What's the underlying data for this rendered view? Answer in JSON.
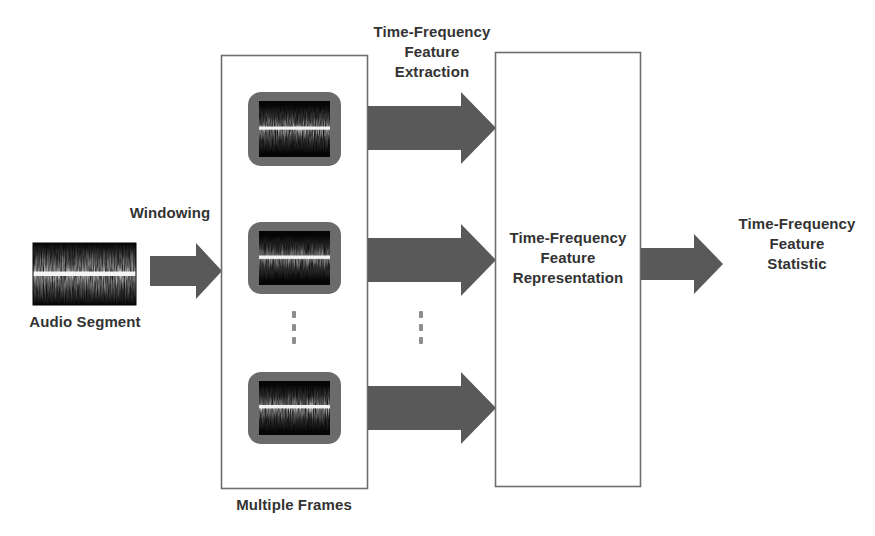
{
  "figure": {
    "type": "block-diagram",
    "colors": {
      "arrow": "#595959",
      "box_border": "#6e6e6e",
      "frame_border": "#6b6b6b",
      "waveform_bg": "#050505",
      "waveform_line": "#f2f2f2",
      "text": "#333333",
      "dots": "#8d8d8d",
      "background": "#ffffff"
    }
  },
  "nodes": {
    "audio_segment": {
      "label": "Audio Segment",
      "kind": "waveform-image"
    },
    "multiple_frames": {
      "label": "Multiple Frames",
      "kind": "container-box",
      "frames": [
        {
          "name": "frame-1"
        },
        {
          "name": "frame-2"
        },
        {
          "name": "frame-3"
        }
      ],
      "ellipsis": "vertical-dots"
    },
    "tf_representation": {
      "label": "Time-Frequency\nFeature\nRepresentation",
      "kind": "container-box"
    },
    "tf_statistic": {
      "label": "Time-Frequency\nFeature\nStatistic",
      "kind": "text-node"
    }
  },
  "edges": [
    {
      "name": "windowing-arrow",
      "label": "Windowing",
      "from": "audio_segment",
      "to": "multiple_frames"
    },
    {
      "name": "extraction-arrow-1",
      "label": "Time-Frequency\nFeature\nExtraction",
      "from": "frame-1",
      "to": "tf_representation"
    },
    {
      "name": "extraction-arrow-2",
      "label": "",
      "from": "frame-2",
      "to": "tf_representation"
    },
    {
      "name": "extraction-arrow-3",
      "label": "",
      "from": "frame-3",
      "to": "tf_representation"
    },
    {
      "name": "statistic-arrow",
      "label": "",
      "from": "tf_representation",
      "to": "tf_statistic"
    }
  ],
  "ellipsis_between_arrows": "vertical-dots"
}
